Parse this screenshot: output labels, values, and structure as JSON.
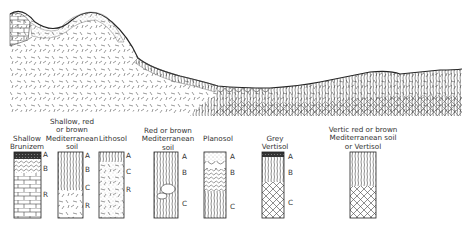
{
  "profiles": [
    {
      "name": "Shallow Brunizem",
      "lines": [
        "Shallow",
        "Brunizem"
      ],
      "horizons": [
        "A",
        "B",
        "R"
      ]
    },
    {
      "name": "Shallow, red or brown Mediterranean soil",
      "lines": [
        "Shallow, red",
        "or brown",
        "Mediterranean",
        "soil"
      ],
      "horizons": [
        "A",
        "B",
        "C",
        "R"
      ]
    },
    {
      "name": "Lithosol",
      "lines": [
        "Lithosol"
      ],
      "horizons": [
        "A",
        "C",
        "R"
      ]
    },
    {
      "name": "Red or brown Mediterranean soil",
      "lines": [
        "Red or brown",
        "Mediterranean",
        "soil"
      ],
      "horizons": [
        "A",
        "B",
        "C"
      ]
    },
    {
      "name": "Planosol",
      "lines": [
        "Planosol"
      ],
      "horizons": [
        "A",
        "B",
        "C"
      ]
    },
    {
      "name": "Grey Vertisol",
      "lines": [
        "Grey",
        "Vertisol"
      ],
      "horizons": [
        "A",
        "B",
        "C"
      ]
    },
    {
      "name": "Vertic red or brown Mediterranean soil or Vertisol",
      "lines": [
        "Vertic red or brown",
        "Mediterranean soil",
        "or Vertisol"
      ],
      "horizons": [
        "A",
        "B",
        "C"
      ]
    }
  ],
  "colors": {
    "ink": "#2a2a2a",
    "paper": "#ffffff"
  }
}
